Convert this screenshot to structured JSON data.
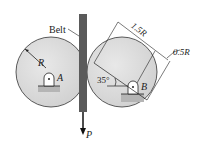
{
  "diagram": {
    "labels": {
      "belt": "Belt",
      "radius": "R",
      "pin_a": "A",
      "pin_b": "B",
      "angle": "35°",
      "dim_long": "1.5R",
      "dim_short": "0.5R",
      "force": "P"
    },
    "colors": {
      "disk_fill": "#d9d9d9",
      "belt_fill": "#555555",
      "support_fill": "#b5b5b5",
      "line": "#222222"
    }
  }
}
